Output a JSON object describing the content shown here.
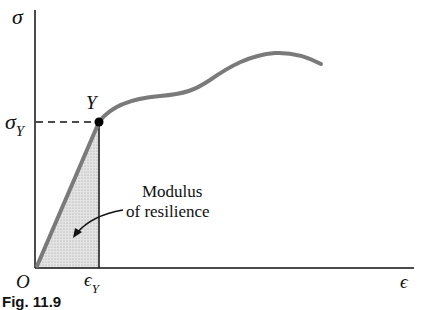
{
  "diagram": {
    "type": "stress-strain curve",
    "axes": {
      "y_label": "σ",
      "x_label": "ϵ",
      "origin_label": "O"
    },
    "yield_point": {
      "label": "Y",
      "stress_label": "σ",
      "stress_subscript": "Y",
      "strain_label": "ϵ",
      "strain_subscript": "Y"
    },
    "shaded_region": {
      "annotation_line1": "Modulus",
      "annotation_line2": "of resilience"
    },
    "caption": "Fig. 11.9",
    "colors": {
      "curve": "#7a7a7a",
      "axes": "#111111",
      "shading": "#d9d9d9"
    }
  }
}
